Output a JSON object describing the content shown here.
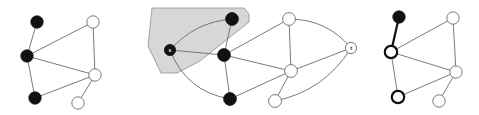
{
  "figure": {
    "background_color": "#ffffff",
    "width": 479,
    "height": 115,
    "colors": {
      "edge": "#6b6b6b",
      "edge_highlight": "#111111",
      "node_filled": "#111111",
      "node_open_fill": "#ffffff",
      "node_open_stroke": "#6b6b6b",
      "node_ring_stroke": "#111111",
      "region_fill": "#d4d4d4",
      "region_stroke": "#9a9a9a",
      "label_on_dark": "#ffffff",
      "label_on_light": "#111111"
    }
  },
  "panels": [
    {
      "id": "panel-left",
      "name": "left-graph",
      "caption": "",
      "nodes": [
        {
          "id": "L1",
          "label": "",
          "x": 37,
          "y": 22,
          "r": 6.2,
          "style": "filled"
        },
        {
          "id": "L2",
          "label": "",
          "x": 27,
          "y": 56,
          "r": 6.2,
          "style": "filled"
        },
        {
          "id": "L3",
          "label": "",
          "x": 35,
          "y": 98,
          "r": 6.2,
          "style": "filled"
        },
        {
          "id": "L4",
          "label": "",
          "x": 93,
          "y": 22,
          "r": 6.2,
          "style": "open"
        },
        {
          "id": "L5",
          "label": "",
          "x": 95,
          "y": 75,
          "r": 6.2,
          "style": "open"
        },
        {
          "id": "L6",
          "label": "",
          "x": 78,
          "y": 103,
          "r": 6.2,
          "style": "open"
        }
      ],
      "edges": [
        {
          "from": "L1",
          "to": "L2",
          "style": "plain",
          "curve": 0
        },
        {
          "from": "L2",
          "to": "L3",
          "style": "plain",
          "curve": 0
        },
        {
          "from": "L2",
          "to": "L4",
          "style": "plain",
          "curve": 0
        },
        {
          "from": "L2",
          "to": "L5",
          "style": "plain",
          "curve": 0
        },
        {
          "from": "L3",
          "to": "L5",
          "style": "plain",
          "curve": 0
        },
        {
          "from": "L4",
          "to": "L5",
          "style": "plain",
          "curve": 0
        },
        {
          "from": "L5",
          "to": "L6",
          "style": "plain",
          "curve": 0
        }
      ]
    },
    {
      "id": "panel-middle",
      "name": "middle-graph-with-cut-region",
      "caption": "",
      "region": {
        "name": "source-side-cut-region",
        "points": "152,8 244,8 249,14 249,22 200,61 177,73 161,73 148,46"
      },
      "nodes": [
        {
          "id": "M_s",
          "label": "s",
          "x": 170,
          "y": 50,
          "r": 5.6,
          "style": "filled",
          "label_color": "on-dark"
        },
        {
          "id": "M1",
          "label": "",
          "x": 232,
          "y": 19,
          "r": 6.4,
          "style": "filled"
        },
        {
          "id": "M2",
          "label": "",
          "x": 224,
          "y": 55,
          "r": 6.4,
          "style": "filled"
        },
        {
          "id": "M3",
          "label": "",
          "x": 230,
          "y": 99,
          "r": 6.4,
          "style": "filled"
        },
        {
          "id": "M4",
          "label": "",
          "x": 289,
          "y": 19,
          "r": 6.4,
          "style": "open"
        },
        {
          "id": "M5",
          "label": "",
          "x": 291,
          "y": 71,
          "r": 6.4,
          "style": "open"
        },
        {
          "id": "M6",
          "label": "",
          "x": 275,
          "y": 101,
          "r": 6.4,
          "style": "open"
        },
        {
          "id": "M_t",
          "label": "t",
          "x": 351,
          "y": 48,
          "r": 5.6,
          "style": "open",
          "label_color": "on-light"
        }
      ],
      "edges": [
        {
          "from": "M_s",
          "to": "M1",
          "style": "curved",
          "curve": -14
        },
        {
          "from": "M_s",
          "to": "M2",
          "style": "plain",
          "curve": 0
        },
        {
          "from": "M_s",
          "to": "M3",
          "style": "curved",
          "curve": 22
        },
        {
          "from": "M1",
          "to": "M2",
          "style": "plain",
          "curve": 0
        },
        {
          "from": "M2",
          "to": "M3",
          "style": "plain",
          "curve": 0
        },
        {
          "from": "M2",
          "to": "M4",
          "style": "plain",
          "curve": 0
        },
        {
          "from": "M2",
          "to": "M5",
          "style": "plain",
          "curve": 0
        },
        {
          "from": "M3",
          "to": "M5",
          "style": "plain",
          "curve": 0
        },
        {
          "from": "M4",
          "to": "M5",
          "style": "plain",
          "curve": 0
        },
        {
          "from": "M5",
          "to": "M6",
          "style": "plain",
          "curve": 0
        },
        {
          "from": "M4",
          "to": "M_t",
          "style": "curved",
          "curve": -16
        },
        {
          "from": "M5",
          "to": "M_t",
          "style": "plain",
          "curve": 0
        },
        {
          "from": "M6",
          "to": "M_t",
          "style": "curved",
          "curve": 20
        }
      ]
    },
    {
      "id": "panel-right",
      "name": "right-graph-highlighted-path",
      "caption": "",
      "nodes": [
        {
          "id": "R1",
          "label": "",
          "x": 399,
          "y": 17,
          "r": 6.2,
          "style": "filled"
        },
        {
          "id": "R2",
          "label": "",
          "x": 391,
          "y": 52,
          "r": 6.2,
          "style": "ring"
        },
        {
          "id": "R3",
          "label": "",
          "x": 398,
          "y": 97,
          "r": 6.2,
          "style": "ring"
        },
        {
          "id": "R4",
          "label": "",
          "x": 453,
          "y": 18,
          "r": 6.2,
          "style": "open"
        },
        {
          "id": "R5",
          "label": "",
          "x": 456,
          "y": 72,
          "r": 6.2,
          "style": "open"
        },
        {
          "id": "R6",
          "label": "",
          "x": 439,
          "y": 101,
          "r": 6.2,
          "style": "open"
        }
      ],
      "edges": [
        {
          "from": "R1",
          "to": "R2",
          "style": "bold",
          "curve": 0
        },
        {
          "from": "R2",
          "to": "R3",
          "style": "plain",
          "curve": 0
        },
        {
          "from": "R2",
          "to": "R4",
          "style": "plain",
          "curve": 0
        },
        {
          "from": "R2",
          "to": "R5",
          "style": "plain",
          "curve": 0
        },
        {
          "from": "R3",
          "to": "R5",
          "style": "plain",
          "curve": 0
        },
        {
          "from": "R4",
          "to": "R5",
          "style": "plain",
          "curve": 0
        },
        {
          "from": "R5",
          "to": "R6",
          "style": "plain",
          "curve": 0
        }
      ]
    }
  ]
}
